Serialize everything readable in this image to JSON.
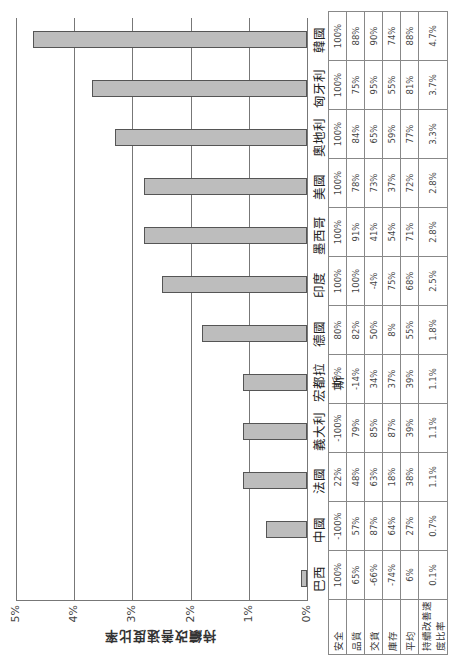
{
  "chart_data": {
    "type": "bar",
    "title": "",
    "xlabel": "",
    "ylabel": "持續改善速度比率",
    "ylim": [
      0,
      5
    ],
    "yticks": [
      "0%",
      "1%",
      "2%",
      "3%",
      "4%",
      "5%"
    ],
    "grid": true,
    "orientation_note": "figure rotated 90° counter-clockwise on page",
    "categories": [
      "巴西",
      "中國",
      "法國",
      "義大利",
      "宏都拉斯",
      "德國",
      "印度",
      "墨西哥",
      "美國",
      "奧地利",
      "匈牙利",
      "韓國"
    ],
    "values": [
      0.1,
      0.7,
      1.1,
      1.1,
      1.1,
      1.8,
      2.5,
      2.8,
      2.8,
      3.3,
      3.7,
      4.7
    ]
  },
  "table": {
    "row_headers": [
      "安全",
      "品質",
      "交貨",
      "庫存",
      "平均",
      "持續改善速度比率"
    ],
    "columns": [
      {
        "country": "巴西",
        "values": [
          "100%",
          "65%",
          "-66%",
          "-74%",
          "6%",
          "0.1%"
        ]
      },
      {
        "country": "中國",
        "values": [
          "-100%",
          "57%",
          "87%",
          "64%",
          "27%",
          "0.7%"
        ]
      },
      {
        "country": "法國",
        "values": [
          "22%",
          "48%",
          "63%",
          "18%",
          "38%",
          "1.1%"
        ]
      },
      {
        "country": "義大利",
        "values": [
          "-100%",
          "79%",
          "85%",
          "87%",
          "39%",
          "1.1%"
        ]
      },
      {
        "country": "宏都拉斯",
        "values": [
          "100%",
          "-14%",
          "34%",
          "37%",
          "39%",
          "1.1%"
        ]
      },
      {
        "country": "德國",
        "values": [
          "80%",
          "82%",
          "50%",
          "8%",
          "55%",
          "1.8%"
        ]
      },
      {
        "country": "印度",
        "values": [
          "100%",
          "100%",
          "-4%",
          "75%",
          "68%",
          "2.5%"
        ]
      },
      {
        "country": "墨西哥",
        "values": [
          "100%",
          "91%",
          "41%",
          "54%",
          "71%",
          "2.8%"
        ]
      },
      {
        "country": "美國",
        "values": [
          "100%",
          "78%",
          "73%",
          "37%",
          "72%",
          "2.8%"
        ]
      },
      {
        "country": "奧地利",
        "values": [
          "100%",
          "84%",
          "65%",
          "59%",
          "77%",
          "3.3%"
        ]
      },
      {
        "country": "匈牙利",
        "values": [
          "100%",
          "75%",
          "95%",
          "55%",
          "81%",
          "3.7%"
        ]
      },
      {
        "country": "韓國",
        "values": [
          "100%",
          "88%",
          "90%",
          "74%",
          "88%",
          "4.7%"
        ]
      }
    ]
  },
  "colors": {
    "bar_fill": "#bdbdbd",
    "bar_border": "#555555",
    "grid": "#777777"
  }
}
